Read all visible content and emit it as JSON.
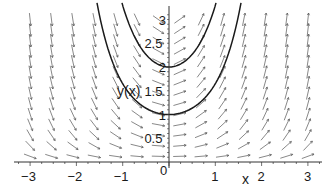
{
  "chart_data": {
    "type": "line",
    "title": "",
    "xlabel": "x",
    "ylabel": "y(x)",
    "xlim": [
      -3.3,
      3.4
    ],
    "ylim": [
      -0.05,
      3.3
    ],
    "grid": false,
    "legend": null,
    "x_ticks": [
      -3,
      -2,
      -1,
      0,
      1,
      2,
      3
    ],
    "x_tick_labels": [
      "−3",
      "−2",
      "−1",
      "0",
      "1",
      "2",
      "3"
    ],
    "y_ticks": [
      0.5,
      1,
      1.5,
      2,
      2.5,
      3
    ],
    "y_tick_labels": [
      "0.5",
      "1",
      "1.5",
      "2",
      "2.5",
      "3"
    ],
    "slope_field": {
      "equation": "dy/dx = x*y",
      "x_range": [
        -3,
        3
      ],
      "y_range": [
        0,
        3
      ],
      "x_count": 14,
      "y_count": 14
    },
    "series": [
      {
        "name": "y(0)=1",
        "formula": "y = exp(x^2/2)",
        "x": [
          -1.48,
          -1.2,
          -1.0,
          -0.5,
          0,
          0.5,
          1.0,
          1.2,
          1.48
        ],
        "values": [
          3.0,
          2.05,
          1.65,
          1.13,
          1.0,
          1.13,
          1.65,
          2.05,
          3.0
        ]
      },
      {
        "name": "y(0)=2",
        "formula": "y = 2*exp(x^2/2)",
        "x": [
          -0.9,
          -0.7,
          -0.5,
          -0.25,
          0,
          0.25,
          0.5,
          0.7,
          0.9
        ],
        "values": [
          3.0,
          2.55,
          2.27,
          2.06,
          2.0,
          2.06,
          2.27,
          2.55,
          3.0
        ]
      }
    ]
  },
  "labels": {
    "x_axis": "x",
    "y_axis": "y(x)",
    "origin": "0"
  },
  "colors": {
    "axis": "#333333",
    "arrows": "#555555",
    "curve": "#1a1a1a"
  }
}
